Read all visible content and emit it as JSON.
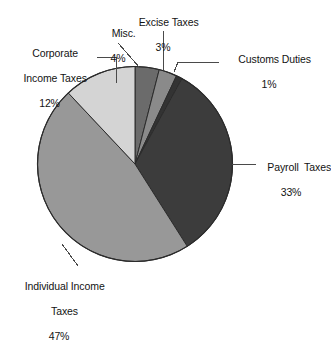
{
  "chart_data": {
    "type": "pie",
    "title": "",
    "categories": [
      "Payroll  Taxes",
      "Individual Income Taxes",
      "Corporate Income Taxes",
      "Misc.",
      "Excise Taxes",
      "Customs Duties"
    ],
    "values": [
      33,
      47,
      12,
      4,
      3,
      1
    ],
    "value_unit": "%",
    "legend": "none",
    "slice_colors": [
      "#3c3c3c",
      "#989898",
      "#d4d4d4",
      "#6b6b6b",
      "#8a8a8a",
      "#333333"
    ],
    "start_angle_deg": 0,
    "direction": "clockwise",
    "slices": [
      {
        "label": "Misc.",
        "pct_text": "4%",
        "value": 4,
        "color": "#6b6b6b"
      },
      {
        "label": "Excise Taxes",
        "pct_text": "3%",
        "value": 3,
        "color": "#8a8a8a"
      },
      {
        "label": "Customs Duties",
        "pct_text": "1%",
        "value": 1,
        "color": "#333333"
      },
      {
        "label": "Payroll  Taxes",
        "pct_text": "33%",
        "value": 33,
        "color": "#3c3c3c"
      },
      {
        "label": "Individual Income Taxes",
        "pct_text": "47%",
        "value": 47,
        "color": "#989898"
      },
      {
        "label": "Corporate Income Taxes",
        "pct_text": "12%",
        "value": 12,
        "color": "#d4d4d4"
      }
    ]
  },
  "labels": {
    "corporate": {
      "line1": "Corporate",
      "line2": "Income Taxes",
      "pct": "12%"
    },
    "misc": {
      "line1": "Misc.",
      "pct": "4%"
    },
    "excise": {
      "line1": "Excise Taxes",
      "pct": "3%"
    },
    "customs": {
      "line1": "Customs Duties",
      "pct": "1%"
    },
    "payroll": {
      "line1": "Payroll  Taxes",
      "pct": "33%"
    },
    "individual": {
      "line1": "Individual Income",
      "line2": "Taxes",
      "pct": "47%"
    }
  },
  "style": {
    "background": "#ffffff",
    "outline": "#2b2b2b",
    "leader_line": "#4a4a4a"
  }
}
